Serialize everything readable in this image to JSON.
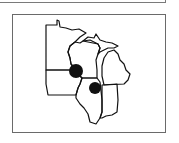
{
  "figure": {
    "type": "map",
    "region": "Upper Midwest United States",
    "states": [
      "Minnesota",
      "Wisconsin",
      "Michigan",
      "Iowa",
      "Illinois",
      "Indiana"
    ],
    "markers": [
      {
        "id": "marker-1",
        "cx": 76,
        "cy": 71,
        "r": 7,
        "color": "#111111"
      },
      {
        "id": "marker-2",
        "cx": 95,
        "cy": 88,
        "r": 6,
        "color": "#111111"
      }
    ],
    "outline_color": "#111111",
    "frame_color": "#6a6a6a"
  }
}
